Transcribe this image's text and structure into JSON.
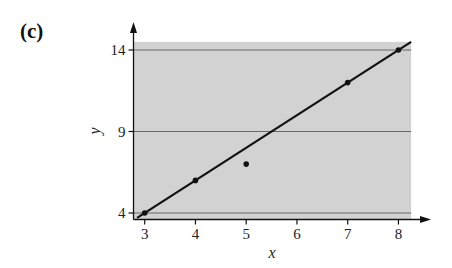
{
  "panel_label": "(c)",
  "colors": {
    "shade": "#d2d2d2",
    "gridline": "#666666",
    "axis": "#111111",
    "line": "#111111",
    "points": "#111111"
  },
  "chart_data": {
    "type": "scatter",
    "title": "",
    "xlabel": "x",
    "ylabel": "y",
    "xlim": [
      2.85,
      8.25
    ],
    "ylim": [
      3.6,
      14.5
    ],
    "x_ticks": [
      3,
      4,
      5,
      6,
      7,
      8
    ],
    "y_ticks": [
      4,
      9,
      14
    ],
    "grid": "horizontal lines at y ticks",
    "shaded_region": {
      "x": [
        2.85,
        8.25
      ],
      "y": [
        3.6,
        14.5
      ]
    },
    "series": [
      {
        "name": "data points",
        "type": "scatter",
        "points": [
          {
            "x": 3,
            "y": 4
          },
          {
            "x": 4,
            "y": 6
          },
          {
            "x": 5,
            "y": 7
          },
          {
            "x": 7,
            "y": 12
          },
          {
            "x": 8,
            "y": 14
          }
        ]
      },
      {
        "name": "fitted line",
        "type": "line",
        "equation": "y = 2x - 2",
        "points": [
          {
            "x": 2.85,
            "y": 3.7
          },
          {
            "x": 8.25,
            "y": 14.5
          }
        ]
      }
    ]
  }
}
